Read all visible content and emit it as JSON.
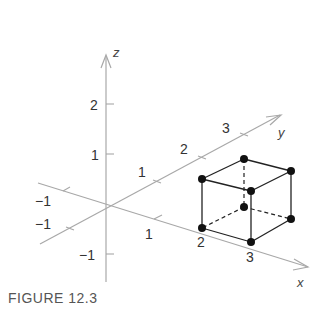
{
  "figure": {
    "caption": "FIGURE 12.3",
    "axes": {
      "x": {
        "name": "x",
        "tick_labels": [
          "−1",
          "1",
          "2",
          "3"
        ]
      },
      "y": {
        "name": "y",
        "tick_labels": [
          "−1",
          "1",
          "2",
          "3"
        ]
      },
      "z": {
        "name": "z",
        "tick_labels": [
          "−1",
          "1",
          "2"
        ]
      }
    },
    "labels": {
      "z_name": "z",
      "y_name": "y",
      "x_name": "x",
      "z_2": "2",
      "z_1": "1",
      "z_neg1": "−1",
      "y_1": "1",
      "y_2": "2",
      "y_3": "3",
      "y_neg1": "−1",
      "x_1": "1",
      "x_2": "2",
      "x_3": "3",
      "x_neg1": "−1"
    },
    "cube": {
      "description": "Unit cube with vertices at x∈{2,3}, y∈{1,2}, z∈{0,1}",
      "vertex_count": 8,
      "colors": {
        "edges": "#222222",
        "vertices": "#111111",
        "axes": "#a8a8a8"
      }
    }
  }
}
